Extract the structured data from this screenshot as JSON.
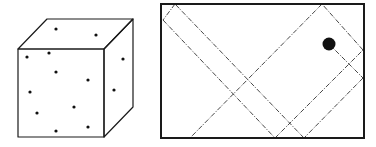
{
  "figure": {
    "width": 376,
    "height": 147,
    "colors": {
      "stroke": "#1a1a1a",
      "background": "#ffffff",
      "dot": "#111111"
    }
  },
  "cube": {
    "label": "box-with-particles",
    "front_face": {
      "x1": 18,
      "y1": 49,
      "x2": 104,
      "y2": 137
    },
    "back_offset": {
      "dx": 29,
      "dy": -30
    },
    "particles": [
      {
        "x": 56,
        "y": 29
      },
      {
        "x": 96,
        "y": 35
      },
      {
        "x": 27,
        "y": 57
      },
      {
        "x": 49,
        "y": 53
      },
      {
        "x": 56,
        "y": 72
      },
      {
        "x": 88,
        "y": 80
      },
      {
        "x": 30,
        "y": 92
      },
      {
        "x": 74,
        "y": 107
      },
      {
        "x": 37,
        "y": 113
      },
      {
        "x": 56,
        "y": 131
      },
      {
        "x": 88,
        "y": 127
      },
      {
        "x": 123,
        "y": 59
      },
      {
        "x": 114,
        "y": 90
      }
    ]
  },
  "billiard": {
    "label": "ball-bouncing-trajectory",
    "box": {
      "x": 161,
      "y": 4,
      "w": 203,
      "h": 134
    },
    "ball": {
      "x": 329,
      "y": 44,
      "r": 6.5
    },
    "trajectory_segments": [
      {
        "x1": 329,
        "y1": 44,
        "x2": 363,
        "y2": 78
      },
      {
        "x1": 363,
        "y1": 78,
        "x2": 304,
        "y2": 138
      },
      {
        "x1": 304,
        "y1": 138,
        "x2": 175,
        "y2": 4
      },
      {
        "x1": 175,
        "y1": 4,
        "x2": 163,
        "y2": 20
      },
      {
        "x1": 163,
        "y1": 20,
        "x2": 275,
        "y2": 138
      },
      {
        "x1": 275,
        "y1": 138,
        "x2": 363,
        "y2": 50
      },
      {
        "x1": 363,
        "y1": 50,
        "x2": 322,
        "y2": 4
      },
      {
        "x1": 322,
        "y1": 4,
        "x2": 190,
        "y2": 138
      }
    ]
  }
}
